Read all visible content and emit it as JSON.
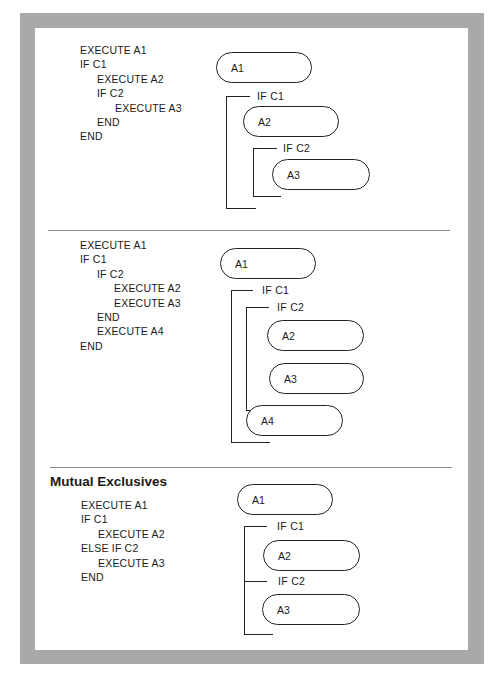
{
  "panels": [
    {
      "code_lines": [
        {
          "indent": 0,
          "text": "EXECUTE A1"
        },
        {
          "indent": 1,
          "text": "IF C1"
        },
        {
          "indent": 2,
          "text": "EXECUTE A2"
        },
        {
          "indent": 2,
          "text": "IF C2"
        },
        {
          "indent": 3,
          "text": "EXECUTE A3"
        },
        {
          "indent": 2,
          "text": "END"
        },
        {
          "indent": 0,
          "text": "END"
        }
      ],
      "diagram": {
        "boxes": [
          "A1",
          "A2",
          "A3"
        ],
        "conditions": [
          "IF C1",
          "IF C2"
        ]
      }
    },
    {
      "code_lines": [
        {
          "indent": 0,
          "text": "EXECUTE A1"
        },
        {
          "indent": 0,
          "text": "IF C1"
        },
        {
          "indent": 1,
          "text": "IF C2"
        },
        {
          "indent": 2,
          "text": "EXECUTE A2"
        },
        {
          "indent": 2,
          "text": "EXECUTE A3"
        },
        {
          "indent": 1,
          "text": "END"
        },
        {
          "indent": 1,
          "text": "EXECUTE A4"
        },
        {
          "indent": 0,
          "text": "END"
        }
      ],
      "diagram": {
        "boxes": [
          "A1",
          "A2",
          "A3",
          "A4"
        ],
        "conditions": [
          "IF C1",
          "IF C2"
        ]
      }
    },
    {
      "heading": "Mutual Exclusives",
      "code_lines": [
        {
          "indent": 0,
          "text": "EXECUTE A1"
        },
        {
          "indent": 0,
          "text": "IF C1"
        },
        {
          "indent": 1,
          "text": "EXECUTE A2"
        },
        {
          "indent": 0,
          "text": "ELSE IF C2"
        },
        {
          "indent": 1,
          "text": "EXECUTE A3"
        },
        {
          "indent": 0,
          "text": "END"
        }
      ],
      "diagram": {
        "boxes": [
          "A1",
          "A2",
          "A3"
        ],
        "conditions": [
          "IF C1",
          "IF C2"
        ]
      }
    }
  ]
}
